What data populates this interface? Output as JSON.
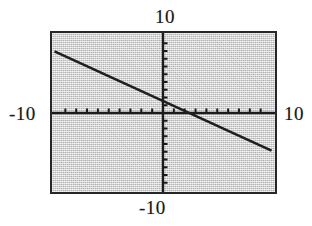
{
  "figure": {
    "kind": "graphing-calculator-screen",
    "background_color": "#d7d7d7",
    "frame_color": "#272727",
    "ink_color": "#1a1a1a",
    "labels": {
      "top": "10",
      "bottom": "-10",
      "left": "-10",
      "right": "10"
    }
  },
  "chart_data": {
    "type": "line",
    "title": "",
    "xlabel": "",
    "ylabel": "",
    "xlim": [
      -10,
      10
    ],
    "ylim": [
      -10,
      10
    ],
    "grid": false,
    "legend": null,
    "axes": {
      "x_axis_label_left": "-10",
      "x_axis_label_right": "10",
      "y_axis_label_top": "10",
      "y_axis_label_bottom": "-10",
      "tick_spacing": 1,
      "x_ticks": [
        -9,
        -8,
        -7,
        -6,
        -5,
        -4,
        -3,
        -2,
        -1,
        1,
        2,
        3,
        4,
        5,
        6,
        7,
        8,
        9
      ],
      "y_ticks": [
        -9,
        -8,
        -7,
        -6,
        -5,
        -4,
        -3,
        -2,
        -1,
        1,
        2,
        3,
        4,
        5,
        6,
        7,
        8,
        9
      ],
      "tick_labels_shown": false
    },
    "series": [
      {
        "name": "line",
        "color": "#1f1f1f",
        "slope": -0.64,
        "intercept": 1.55,
        "x_intercept": 2.4,
        "y_intercept": 1.55,
        "points": [
          {
            "x": -8.4,
            "y": 10.0
          },
          {
            "x": 0.0,
            "y": 1.55
          },
          {
            "x": 2.4,
            "y": 0.0
          },
          {
            "x": 10.0,
            "y": -4.85
          }
        ]
      }
    ]
  }
}
